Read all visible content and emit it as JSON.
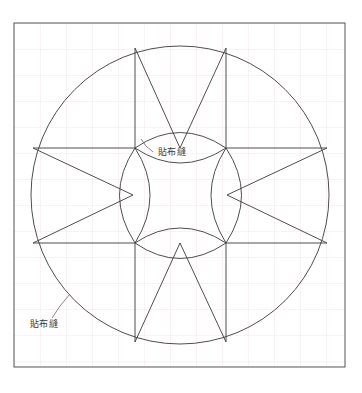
{
  "page": {
    "background_color": "#ffffff",
    "width": 362,
    "height": 393
  },
  "grid": {
    "visible": true,
    "color": "#f0e2e2",
    "spacing": 26,
    "origin_x": 14,
    "origin_y": 23
  },
  "frame": {
    "name": "outer-border",
    "x": 14,
    "y": 23,
    "width": 331,
    "height": 344,
    "stroke_color": "#555555",
    "stroke_width": 1,
    "fill": "none"
  },
  "drawing": {
    "stroke_color": "#3a3a3a",
    "stroke_width": 0.9,
    "outer_circle": {
      "name": "outer-circle",
      "cx": 180,
      "cy": 195,
      "r": 149
    },
    "inner_circle": {
      "name": "inner-circle",
      "cx": 180,
      "cy": 195,
      "r": 47
    },
    "star_nodes": {
      "top_left": {
        "x": 135,
        "y": 48
      },
      "top_right": {
        "x": 226,
        "y": 48
      },
      "left_top": {
        "x": 33,
        "y": 148
      },
      "right_top": {
        "x": 327,
        "y": 148
      },
      "left_bottom": {
        "x": 33,
        "y": 243
      },
      "right_bottom": {
        "x": 327,
        "y": 243
      },
      "bottom_left": {
        "x": 135,
        "y": 342
      },
      "bottom_right": {
        "x": 226,
        "y": 342
      },
      "inner_top": {
        "x": 180,
        "y": 148
      },
      "inner_bottom": {
        "x": 180,
        "y": 243
      },
      "inner_left": {
        "x": 133,
        "y": 195
      },
      "inner_right": {
        "x": 227,
        "y": 195
      },
      "corner_tl": {
        "x": 135,
        "y": 148
      },
      "corner_tr": {
        "x": 226,
        "y": 148
      },
      "corner_bl": {
        "x": 135,
        "y": 243
      },
      "corner_br": {
        "x": 226,
        "y": 243
      }
    }
  },
  "annotations": [
    {
      "name": "appliqué-label-center",
      "text": "貼布縫",
      "text_x": 158,
      "text_y": 155,
      "leader": "M 153 152 L 146 146 L 141 139",
      "anchor": "start"
    },
    {
      "name": "appliqué-label-outer",
      "text": "貼布縫",
      "text_x": 30,
      "text_y": 327,
      "leader": "M 52 318 L 60 306 L 70 294",
      "anchor": "start"
    }
  ]
}
